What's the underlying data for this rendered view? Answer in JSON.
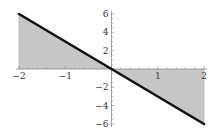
{
  "chart_data": {
    "type": "area",
    "title": "",
    "xlabel": "",
    "ylabel": "",
    "function": "y = -3x",
    "x": [
      -2,
      -1,
      0,
      1,
      2
    ],
    "series": [
      {
        "name": "y = -3x",
        "values": [
          6,
          3,
          0,
          -3,
          -6
        ]
      }
    ],
    "fill": "between curve and x-axis",
    "xlim": [
      -2,
      2
    ],
    "ylim": [
      -6,
      6
    ],
    "x_ticks": [
      "-2",
      "-1",
      "1",
      "2"
    ],
    "y_ticks": [
      "6",
      "4",
      "2",
      "-2",
      "-4",
      "-6"
    ],
    "grid": false,
    "legend": null
  },
  "colors": {
    "line": "#111111",
    "fill": "#c6c6c6",
    "axis": "#888888"
  }
}
